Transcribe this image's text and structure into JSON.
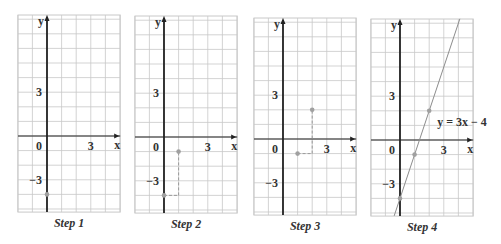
{
  "figure": {
    "unit_px": 14.6,
    "x_range": [
      -2,
      5
    ],
    "y_range": [
      -5.2,
      8.3
    ],
    "axis_labels": {
      "x": "x",
      "y": "y"
    },
    "tick_labels": {
      "origin": "0",
      "x3": "3",
      "y3": "3",
      "yneg3": "−3"
    },
    "colors": {
      "grid": "#c8c8c8",
      "axis": "#222222",
      "point": "#a0a0a0",
      "dash": "#9a9a9a",
      "line": "#8c8c8c",
      "text": "#333333"
    }
  },
  "panels": [
    {
      "caption": "Step 1",
      "left": 18,
      "top": 15,
      "origin_x": 47,
      "origin_y": 136,
      "points": [
        [
          0,
          -4
        ]
      ],
      "dashes": [],
      "line": null,
      "equation": null
    },
    {
      "caption": "Step 2",
      "left": 135,
      "top": 16,
      "origin_x": 164,
      "origin_y": 137,
      "points": [
        [
          0,
          -4
        ],
        [
          1,
          -1
        ]
      ],
      "dashes": [
        [
          [
            0,
            -4
          ],
          [
            1,
            -4
          ]
        ],
        [
          [
            1,
            -4
          ],
          [
            1,
            -1
          ]
        ]
      ],
      "line": null,
      "equation": null
    },
    {
      "caption": "Step 3",
      "left": 254,
      "top": 18,
      "origin_x": 283,
      "origin_y": 139,
      "points": [
        [
          1,
          -1
        ],
        [
          2,
          2
        ]
      ],
      "dashes": [
        [
          [
            1,
            -1
          ],
          [
            2,
            -1
          ]
        ],
        [
          [
            2,
            -1
          ],
          [
            2,
            2
          ]
        ]
      ],
      "line": null,
      "equation": null
    },
    {
      "caption": "Step 4",
      "left": 371,
      "top": 19,
      "origin_x": 400,
      "origin_y": 140,
      "points": [
        [
          0,
          -4
        ],
        [
          1,
          -1
        ],
        [
          2,
          2
        ]
      ],
      "dashes": [],
      "line": {
        "slope": 3,
        "intercept": -4
      },
      "equation": "y = 3x − 4"
    }
  ],
  "chart_data": {
    "type": "line",
    "xlabel": "x",
    "ylabel": "y",
    "xlim": [
      -2,
      5
    ],
    "ylim": [
      -5,
      8
    ],
    "grid": true,
    "steps": [
      {
        "label": "Step 1",
        "points": [
          {
            "x": 0,
            "y": -4
          }
        ]
      },
      {
        "label": "Step 2",
        "points": [
          {
            "x": 0,
            "y": -4
          },
          {
            "x": 1,
            "y": -1
          }
        ],
        "run": 1,
        "rise": 3
      },
      {
        "label": "Step 3",
        "points": [
          {
            "x": 1,
            "y": -1
          },
          {
            "x": 2,
            "y": 2
          }
        ],
        "run": 1,
        "rise": 3
      },
      {
        "label": "Step 4",
        "points": [
          {
            "x": 0,
            "y": -4
          },
          {
            "x": 1,
            "y": -1
          },
          {
            "x": 2,
            "y": 2
          }
        ],
        "line": "y = 3x − 4",
        "slope": 3,
        "intercept": -4
      }
    ]
  }
}
